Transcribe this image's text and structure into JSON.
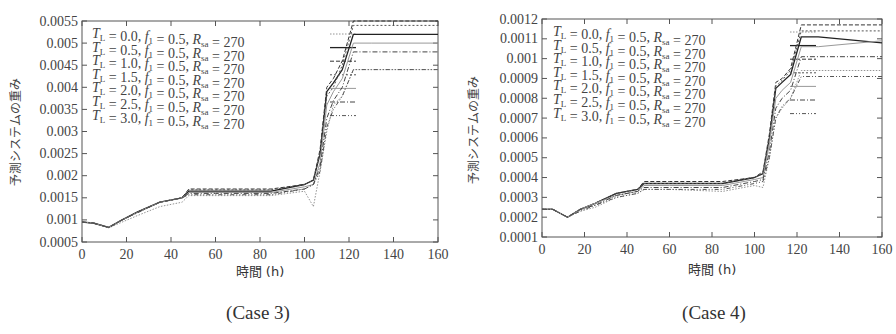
{
  "chart_data": [
    {
      "type": "line",
      "caption": "(Case 3)",
      "xlabel": "時間 (h)",
      "ylabel": "予測システムの重み",
      "xlim": [
        0,
        160
      ],
      "ylim": [
        0.0005,
        0.0055
      ],
      "xticks": [
        0,
        20,
        40,
        60,
        80,
        100,
        120,
        140,
        160
      ],
      "yticks": [
        "0.0005",
        "0.001",
        "0.0015",
        "0.002",
        "0.0025",
        "0.003",
        "0.0035",
        "0.004",
        "0.0045",
        "0.005",
        "0.0055"
      ],
      "legend_position": "top-left",
      "x": [
        0,
        5,
        12,
        18,
        25,
        35,
        45,
        48,
        60,
        85,
        100,
        104,
        107,
        110,
        113,
        117,
        122,
        130,
        160
      ],
      "series": [
        {
          "name": "T_L = 0.0, f_1 = 0.5, R_sa = 270",
          "style": "dotted-light",
          "values": [
            0.00095,
            0.00093,
            0.00082,
            0.00095,
            0.0011,
            0.0013,
            0.0014,
            0.00155,
            0.00155,
            0.00155,
            0.00165,
            0.0013,
            0.0021,
            0.003,
            0.0036,
            0.0038,
            0.0044,
            0.0044,
            0.0044
          ]
        },
        {
          "name": "T_L = 0.5, f_1 = 0.5, R_sa = 270",
          "style": "solid",
          "values": [
            0.00095,
            0.00093,
            0.00083,
            0.001,
            0.00118,
            0.0014,
            0.0015,
            0.00165,
            0.00165,
            0.00165,
            0.0018,
            0.0019,
            0.0025,
            0.0039,
            0.0041,
            0.0044,
            0.0052,
            0.0052,
            0.0052
          ]
        },
        {
          "name": "T_L = 1.0, f_1 = 0.5, R_sa = 270",
          "style": "dashed",
          "values": [
            0.00095,
            0.00093,
            0.00083,
            0.001,
            0.00118,
            0.0014,
            0.0015,
            0.0017,
            0.0017,
            0.0017,
            0.0018,
            0.0019,
            0.0026,
            0.004,
            0.0042,
            0.0046,
            0.0055,
            0.0055,
            0.0055
          ]
        },
        {
          "name": "T_L = 1.5, f_1 = 0.5, R_sa = 270",
          "style": "short-dashed",
          "values": [
            0.00095,
            0.00093,
            0.00083,
            0.001,
            0.00118,
            0.0014,
            0.0015,
            0.00168,
            0.00168,
            0.00168,
            0.0018,
            0.0019,
            0.0025,
            0.0038,
            0.004,
            0.0045,
            0.0054,
            0.0054,
            0.0054
          ]
        },
        {
          "name": "T_L = 2.0, f_1 = 0.5, R_sa = 270",
          "style": "solid-light",
          "values": [
            0.00095,
            0.00093,
            0.00083,
            0.001,
            0.00117,
            0.0014,
            0.0015,
            0.00162,
            0.00162,
            0.00162,
            0.00175,
            0.0018,
            0.0023,
            0.0036,
            0.0039,
            0.0042,
            0.005,
            0.005,
            0.005
          ]
        },
        {
          "name": "T_L = 2.5, f_1 = 0.5, R_sa = 270",
          "style": "dash-dot",
          "values": [
            0.00095,
            0.00093,
            0.00083,
            0.001,
            0.00117,
            0.0014,
            0.0015,
            0.0016,
            0.0016,
            0.0016,
            0.0017,
            0.0018,
            0.0022,
            0.0033,
            0.0037,
            0.004,
            0.0048,
            0.0048,
            0.0048
          ]
        },
        {
          "name": "T_L = 3.0, f_1 = 0.5, R_sa = 270",
          "style": "dash-dot-dot",
          "values": [
            0.00095,
            0.00093,
            0.00083,
            0.001,
            0.00116,
            0.0014,
            0.0015,
            0.00157,
            0.00157,
            0.00157,
            0.0017,
            0.0018,
            0.0021,
            0.0031,
            0.0035,
            0.0038,
            0.0044,
            0.0044,
            0.0044
          ]
        }
      ]
    },
    {
      "type": "line",
      "caption": "(Case 4)",
      "xlabel": "時間 (h)",
      "ylabel": "予測システムの重み",
      "xlim": [
        0,
        160
      ],
      "ylim": [
        0.0001,
        0.0012
      ],
      "xticks": [
        0,
        20,
        40,
        60,
        80,
        100,
        120,
        140,
        160
      ],
      "yticks": [
        "0.0001",
        "0.0002",
        "0.0003",
        "0.0004",
        "0.0005",
        "0.0006",
        "0.0007",
        "0.0008",
        "0.0009",
        "0.001",
        "0.0011",
        "0.0012"
      ],
      "legend_position": "top-left",
      "x": [
        0,
        5,
        12,
        18,
        25,
        35,
        45,
        48,
        60,
        85,
        100,
        104,
        107,
        110,
        113,
        117,
        122,
        130,
        160
      ],
      "series": [
        {
          "name": "T_L = 0.0, f_1 = 0.5, R_sa = 270",
          "style": "dotted-light",
          "values": [
            0.00024,
            0.00024,
            0.0002,
            0.00023,
            0.00025,
            0.0003,
            0.00032,
            0.00034,
            0.00034,
            0.00033,
            0.00036,
            0.00035,
            0.0005,
            0.0007,
            0.00075,
            0.0008,
            0.00094,
            0.00094,
            0.00094
          ]
        },
        {
          "name": "T_L = 0.5, f_1 = 0.5, R_sa = 270",
          "style": "solid",
          "values": [
            0.00024,
            0.00024,
            0.0002,
            0.00024,
            0.00027,
            0.00032,
            0.00034,
            0.00037,
            0.00037,
            0.00037,
            0.0004,
            0.00042,
            0.0006,
            0.00085,
            0.00088,
            0.00092,
            0.00111,
            0.00111,
            0.00108
          ]
        },
        {
          "name": "T_L = 1.0, f_1 = 0.5, R_sa = 270",
          "style": "dashed",
          "values": [
            0.00024,
            0.00024,
            0.0002,
            0.00024,
            0.00027,
            0.00032,
            0.00034,
            0.00038,
            0.00038,
            0.00038,
            0.0004,
            0.00043,
            0.00062,
            0.00088,
            0.0009,
            0.00095,
            0.00117,
            0.00117,
            0.00117
          ]
        },
        {
          "name": "T_L = 1.5, f_1 = 0.5, R_sa = 270",
          "style": "short-dashed",
          "values": [
            0.00024,
            0.00024,
            0.0002,
            0.00024,
            0.00027,
            0.00032,
            0.00034,
            0.00037,
            0.00037,
            0.00037,
            0.0004,
            0.00042,
            0.0006,
            0.00086,
            0.00089,
            0.00094,
            0.00114,
            0.00114,
            0.00114
          ]
        },
        {
          "name": "T_L = 2.0, f_1 = 0.5, R_sa = 270",
          "style": "solid-light",
          "values": [
            0.00024,
            0.00024,
            0.0002,
            0.00024,
            0.00027,
            0.00031,
            0.00033,
            0.00036,
            0.00036,
            0.00036,
            0.00039,
            0.0004,
            0.00057,
            0.0008,
            0.00084,
            0.00088,
            0.00106,
            0.00106,
            0.00109
          ]
        },
        {
          "name": "T_L = 2.5, f_1 = 0.5, R_sa = 270",
          "style": "dash-dot",
          "values": [
            0.00024,
            0.00024,
            0.0002,
            0.00024,
            0.00026,
            0.00031,
            0.00033,
            0.00035,
            0.00035,
            0.00035,
            0.00038,
            0.00039,
            0.00053,
            0.00075,
            0.0008,
            0.00084,
            0.00101,
            0.00101,
            0.00101
          ]
        },
        {
          "name": "T_L = 3.0, f_1 = 0.5, R_sa = 270",
          "style": "dash-dot-dot",
          "values": [
            0.00024,
            0.00024,
            0.0002,
            0.00023,
            0.00026,
            0.0003,
            0.00032,
            0.00034,
            0.00034,
            0.00034,
            0.00037,
            0.00038,
            0.0005,
            0.0007,
            0.00076,
            0.0008,
            0.00091,
            0.00091,
            0.00091
          ]
        }
      ]
    }
  ]
}
